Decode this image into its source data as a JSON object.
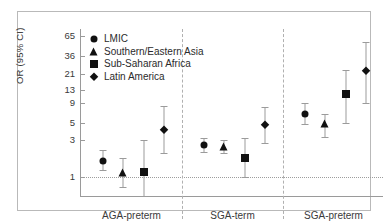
{
  "chart_data": {
    "type": "scatter",
    "title": "",
    "xlabel": "",
    "ylabel": "OR (95% CI)",
    "yscale": "log",
    "ylim": [
      0.55,
      80
    ],
    "yticks": [
      1,
      3,
      5,
      9,
      13,
      21,
      36,
      65
    ],
    "ytick_labels": [
      "1",
      "3",
      "5",
      "9",
      "13",
      "21",
      "36",
      "65"
    ],
    "grid": false,
    "reference_line": 1,
    "legend_position": "top-left",
    "categories": [
      "AGA-preterm",
      "SGA-term",
      "SGA-preterm"
    ],
    "series": [
      {
        "name": "LMIC",
        "marker": "circle",
        "values": [
          1.62,
          2.55,
          6.52
        ],
        "ci_low": [
          1.22,
          2.1,
          4.85
        ],
        "ci_high": [
          2.2,
          3.15,
          8.9
        ]
      },
      {
        "name": "Southern/Eastern Asia",
        "marker": "triangle",
        "values": [
          1.12,
          2.45,
          4.72
        ],
        "ci_low": [
          0.75,
          2.0,
          3.3
        ],
        "ci_high": [
          1.75,
          3.0,
          6.4
        ]
      },
      {
        "name": "Sub-Saharan Africa",
        "marker": "square",
        "values": [
          1.15,
          1.75,
          11.5
        ],
        "ci_low": [
          0.56,
          1.0,
          5.0
        ],
        "ci_high": [
          2.95,
          3.2,
          23.5
        ]
      },
      {
        "name": "Latin America",
        "marker": "diamond",
        "values": [
          4.05,
          4.6,
          23.0
        ],
        "ci_low": [
          2.05,
          2.7,
          9.0
        ],
        "ci_high": [
          8.2,
          8.0,
          55.0
        ]
      }
    ]
  },
  "legend": {
    "items": [
      {
        "label": "LMIC",
        "marker": "circle"
      },
      {
        "label": "Southern/Eastern Asia",
        "marker": "triangle"
      },
      {
        "label": "Sub-Saharan Africa",
        "marker": "square"
      },
      {
        "label": "Latin America",
        "marker": "diamond"
      }
    ]
  },
  "axes": {
    "y_title": "OR (95% CI)"
  }
}
